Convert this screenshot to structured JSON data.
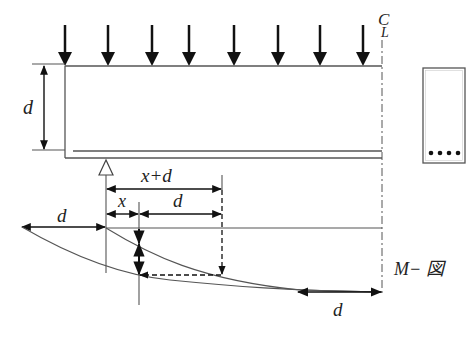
{
  "diagram": {
    "labels": {
      "depth_left": "d",
      "x_plus_d": "x+d",
      "x": "x",
      "d_mid": "d",
      "d_left_shift": "d",
      "d_bottom": "d",
      "centerline_top": "C",
      "centerline_bottom": "L",
      "moment_diagram": "M− 図"
    },
    "loads": {
      "count": 8,
      "type": "uniform point loads (downward arrows)"
    },
    "cross_section": {
      "rebar_count": 4,
      "rebar_position": "bottom"
    },
    "colors": {
      "line": "#555555",
      "arrow": "#111111",
      "background": "#ffffff"
    }
  }
}
